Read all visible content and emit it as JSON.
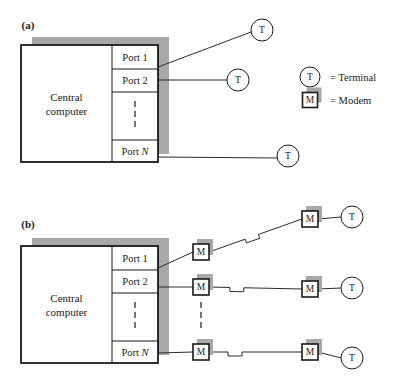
{
  "figure": {
    "panels": [
      {
        "id": "a",
        "label": "(a)",
        "label_x": 28,
        "label_y": 29,
        "description": "Directly connected terminals",
        "computer": {
          "title_line1": "Central",
          "title_line2": "computer",
          "x": 21,
          "y": 45,
          "width": 137,
          "height": 117,
          "shadow_dx": 11,
          "shadow_dy": -8,
          "divider_x": 112
        },
        "ports": [
          {
            "name": "Port 1",
            "italic_tail": "",
            "y_top": 45,
            "y_bottom": 69,
            "label_y": 61,
            "link_y": 67
          },
          {
            "name": "Port 2",
            "italic_tail": "",
            "y_top": 69,
            "y_bottom": 92,
            "label_y": 84,
            "link_y": 80
          },
          {
            "name": "",
            "italic_tail": "",
            "y_top": 92,
            "y_bottom": 140,
            "label_y": 0,
            "link_y": 0,
            "ellipsis": true
          },
          {
            "name": "Port ",
            "italic_tail": "N",
            "y_top": 140,
            "y_bottom": 162,
            "label_y": 155,
            "link_y": 157
          }
        ],
        "ellipsis_x": 135,
        "ellipsis_y_start": 101,
        "nodes": [
          {
            "type": "terminal",
            "glyph": "T",
            "cx": 262,
            "cy": 30,
            "r": 11
          },
          {
            "type": "terminal",
            "glyph": "T",
            "cx": 238,
            "cy": 80,
            "r": 11
          },
          {
            "type": "terminal",
            "glyph": "T",
            "cx": 288,
            "cy": 156,
            "r": 11
          }
        ],
        "links": [
          {
            "from_x": 158,
            "from_y": 67,
            "to_x": 251,
            "to_y": 32
          },
          {
            "from_x": 158,
            "from_y": 80,
            "to_x": 227,
            "to_y": 80
          },
          {
            "from_x": 158,
            "from_y": 157,
            "to_x": 277,
            "to_y": 158
          }
        ]
      },
      {
        "id": "b",
        "label": "(b)",
        "label_x": 28,
        "label_y": 228,
        "description": "Terminals connected via modems over telephone lines",
        "computer": {
          "title_line1": "Central",
          "title_line2": "computer",
          "x": 21,
          "y": 246,
          "width": 137,
          "height": 117,
          "shadow_dx": 11,
          "shadow_dy": -8,
          "divider_x": 112
        },
        "ports": [
          {
            "name": "Port 1",
            "italic_tail": "",
            "y_top": 246,
            "y_bottom": 270,
            "label_y": 262,
            "link_y": 268
          },
          {
            "name": "Port 2",
            "italic_tail": "",
            "y_top": 270,
            "y_bottom": 293,
            "label_y": 285,
            "link_y": 287
          },
          {
            "name": "",
            "italic_tail": "",
            "y_top": 293,
            "y_bottom": 341,
            "label_y": 0,
            "link_y": 0,
            "ellipsis": true
          },
          {
            "name": "Port ",
            "italic_tail": "N",
            "y_top": 341,
            "y_bottom": 363,
            "label_y": 356,
            "link_y": 353
          }
        ],
        "ellipsis_x": 135,
        "ellipsis_y_start": 302,
        "mid_ellipsis_x": 201,
        "mid_ellipsis_y_start": 302,
        "chains": [
          {
            "near_modem": {
              "type": "modem",
              "glyph": "M",
              "cx": 201,
              "cy": 252,
              "size": 16
            },
            "far_modem": {
              "type": "modem",
              "glyph": "M",
              "cx": 310,
              "cy": 219,
              "size": 16
            },
            "terminal": {
              "type": "terminal",
              "glyph": "T",
              "cx": 352,
              "cy": 217,
              "r": 11
            },
            "port_link": {
              "from_x": 158,
              "from_y": 268,
              "to_x": 193,
              "to_y": 252
            },
            "line_break_t": 0.46
          },
          {
            "near_modem": {
              "type": "modem",
              "glyph": "M",
              "cx": 201,
              "cy": 287,
              "size": 16
            },
            "far_modem": {
              "type": "modem",
              "glyph": "M",
              "cx": 310,
              "cy": 289,
              "size": 16
            },
            "terminal": {
              "type": "terminal",
              "glyph": "T",
              "cx": 352,
              "cy": 288,
              "r": 11
            },
            "port_link": {
              "from_x": 158,
              "from_y": 287,
              "to_x": 193,
              "to_y": 287
            },
            "line_break_t": 0.3
          },
          {
            "near_modem": {
              "type": "modem",
              "glyph": "M",
              "cx": 201,
              "cy": 352,
              "size": 16
            },
            "far_modem": {
              "type": "modem",
              "glyph": "M",
              "cx": 310,
              "cy": 352,
              "size": 16
            },
            "terminal": {
              "type": "terminal",
              "glyph": "T",
              "cx": 352,
              "cy": 358,
              "r": 11
            },
            "port_link": {
              "from_x": 158,
              "from_y": 353,
              "to_x": 193,
              "to_y": 352
            },
            "line_break_t": 0.28
          }
        ]
      }
    ],
    "legend": {
      "items": [
        {
          "symbol": "terminal",
          "glyph": "T",
          "text": "= Terminal",
          "x": 310,
          "y": 77,
          "text_x": 330
        },
        {
          "symbol": "modem",
          "glyph": "M",
          "text": "= Modem",
          "x": 310,
          "y": 100,
          "text_x": 330
        }
      ]
    },
    "colors": {
      "ink": "#1a1a1a",
      "shadow": "#a8a8a8",
      "paper": "#ffffff",
      "line": "#2b2b2b"
    }
  }
}
